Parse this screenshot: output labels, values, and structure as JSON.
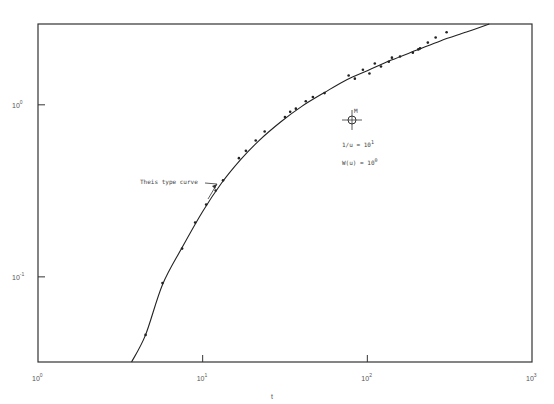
{
  "chart_data": {
    "type": "scatter",
    "title": "",
    "xlabel": "t",
    "ylabel": "",
    "xscale": "log",
    "yscale": "log",
    "xlim": [
      1,
      1000
    ],
    "ylim": [
      0.032,
      2.95
    ],
    "grid": false,
    "x_ticks": [
      {
        "base": "10",
        "exp": "0",
        "value": 1
      },
      {
        "base": "10",
        "exp": "1",
        "value": 10
      },
      {
        "base": "10",
        "exp": "2",
        "value": 100
      },
      {
        "base": "10",
        "exp": "3",
        "value": 1000
      }
    ],
    "y_ticks": [
      {
        "base": "10",
        "exp": "0",
        "value": 1
      },
      {
        "base": "10",
        "exp": "-1",
        "value": 0.1
      }
    ],
    "series": [
      {
        "name": "Observed drawdown",
        "kind": "points",
        "x": [
          4.5,
          5.7,
          7.5,
          9.0,
          10.5,
          12.0,
          13.3,
          16.6,
          18.3,
          21.0,
          23.8,
          31.6,
          34.0,
          36.8,
          42.3,
          46.7,
          55,
          77,
          84,
          94,
          103,
          111,
          121,
          135,
          141,
          158,
          189,
          204,
          209,
          233,
          260,
          303
        ],
        "y": [
          0.046,
          0.092,
          0.146,
          0.207,
          0.263,
          0.318,
          0.364,
          0.49,
          0.54,
          0.62,
          0.7,
          0.85,
          0.91,
          0.95,
          1.05,
          1.11,
          1.17,
          1.48,
          1.42,
          1.6,
          1.52,
          1.74,
          1.67,
          1.78,
          1.88,
          1.91,
          2.01,
          2.1,
          2.13,
          2.3,
          2.46,
          2.64
        ]
      },
      {
        "name": "Theis type curve",
        "kind": "line",
        "x": [
          3.7,
          4.5,
          5.7,
          7.5,
          10,
          13,
          17,
          22,
          30,
          40,
          55,
          75,
          100,
          140,
          200,
          280,
          400,
          550
        ],
        "y": [
          0.032,
          0.046,
          0.09,
          0.148,
          0.24,
          0.35,
          0.48,
          0.62,
          0.8,
          0.98,
          1.18,
          1.4,
          1.58,
          1.82,
          2.08,
          2.36,
          2.65,
          2.95
        ]
      }
    ],
    "annotations": [
      {
        "text": "Theis type curve",
        "points_to": "curve",
        "x": 12.8,
        "y": 0.37
      },
      {
        "text": "M",
        "label": "match point",
        "x": 84,
        "y": 0.84
      },
      {
        "text": "1/u = 10",
        "exp": "1"
      },
      {
        "text": "W(u) = 10",
        "exp": "0"
      }
    ]
  }
}
